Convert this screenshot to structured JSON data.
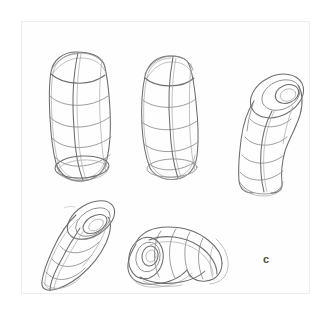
{
  "page": {
    "kind": "pencil-sketch-study-sheet",
    "background_color": "#ffffff",
    "paper_color": "#fefefe",
    "frame_color": "#ededed",
    "pencil_color": "#8b8b8b",
    "pencil_dark_color": "#6d6d6d",
    "figure_label": "c"
  },
  "figures": [
    {
      "id": "figure-1",
      "name": "upright-rounded-cylinder-left",
      "description": "Vertical rounded cylinder with horizontal contour bands, a vertical centerline seam and an elliptical base cap",
      "bands": 6,
      "has_open_end": false
    },
    {
      "id": "figure-2",
      "name": "upright-rounded-cylinder-center",
      "description": "Vertical rounded cylinder, slightly narrower, with horizontal contour bands, a vertical seam line and a shallow elliptical base",
      "bands": 5,
      "has_open_end": false
    },
    {
      "id": "figure-3",
      "name": "bent-tube-upright-right",
      "description": "Bent tube standing upright, curving to the right, with an open end of nested ellipses at the top and contour rings down the shaft",
      "bands": 5,
      "has_open_end": true
    },
    {
      "id": "figure-4",
      "name": "tilted-cylinder-open-top-left",
      "description": "Tilted cylinder leaning to the right with an open top of nested ellipses and diagonal contour rings",
      "bands": 5,
      "has_open_end": true
    },
    {
      "id": "figure-5",
      "name": "horizontal-bent-tube-center",
      "description": "Horizontal banana-shaped bent tube with an open end of nested ellipses on the left and contour rings following the curve",
      "bands": 6,
      "has_open_end": true
    }
  ]
}
